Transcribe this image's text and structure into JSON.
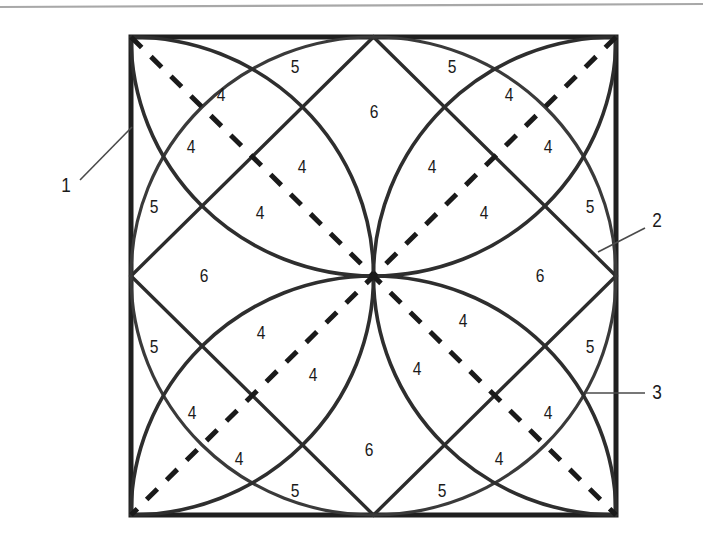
{
  "figure": {
    "background_color": "#ffffff",
    "ink_color": "#1a1a1a",
    "line_color": "#3a3a3a",
    "rule_color": "#a8a8a8",
    "square": {
      "left": 131,
      "top": 37,
      "right": 616,
      "bottom": 515
    },
    "top_rule": {
      "x1": 0,
      "y1": 7,
      "x2": 703,
      "y2": 4
    },
    "region_labels": [
      {
        "id": "r-tl-5",
        "text": "5",
        "x": 295,
        "y": 68
      },
      {
        "id": "r-tr-5",
        "text": "5",
        "x": 452,
        "y": 68
      },
      {
        "id": "r-t-6",
        "text": "6",
        "x": 374,
        "y": 113
      },
      {
        "id": "r-tl-4a",
        "text": "4",
        "x": 221,
        "y": 96
      },
      {
        "id": "r-tr-4a",
        "text": "4",
        "x": 509,
        "y": 96
      },
      {
        "id": "r-tl-4b",
        "text": "4",
        "x": 191,
        "y": 148
      },
      {
        "id": "r-tr-4b",
        "text": "4",
        "x": 548,
        "y": 148
      },
      {
        "id": "r-tl-4c",
        "text": "4",
        "x": 302,
        "y": 168
      },
      {
        "id": "r-tr-4c",
        "text": "4",
        "x": 432,
        "y": 168
      },
      {
        "id": "r-l-5a",
        "text": "5",
        "x": 154,
        "y": 208
      },
      {
        "id": "r-r-5a",
        "text": "5",
        "x": 590,
        "y": 208
      },
      {
        "id": "r-tl-4d",
        "text": "4",
        "x": 260,
        "y": 214
      },
      {
        "id": "r-tr-4d",
        "text": "4",
        "x": 484,
        "y": 214
      },
      {
        "id": "r-l-6",
        "text": "6",
        "x": 204,
        "y": 277
      },
      {
        "id": "r-r-6",
        "text": "6",
        "x": 540,
        "y": 277
      },
      {
        "id": "r-bl-4a",
        "text": "4",
        "x": 261,
        "y": 334
      },
      {
        "id": "r-br-4a",
        "text": "4",
        "x": 463,
        "y": 322
      },
      {
        "id": "r-l-5b",
        "text": "5",
        "x": 154,
        "y": 348
      },
      {
        "id": "r-r-5b",
        "text": "5",
        "x": 590,
        "y": 348
      },
      {
        "id": "r-bl-4b",
        "text": "4",
        "x": 313,
        "y": 376
      },
      {
        "id": "r-br-4b",
        "text": "4",
        "x": 417,
        "y": 370
      },
      {
        "id": "r-bl-4c",
        "text": "4",
        "x": 192,
        "y": 414
      },
      {
        "id": "r-br-4c",
        "text": "4",
        "x": 548,
        "y": 414
      },
      {
        "id": "r-bl-4d",
        "text": "4",
        "x": 239,
        "y": 460
      },
      {
        "id": "r-br-4d",
        "text": "4",
        "x": 499,
        "y": 460
      },
      {
        "id": "r-b-6",
        "text": "6",
        "x": 369,
        "y": 451
      },
      {
        "id": "r-bl-5",
        "text": "5",
        "x": 295,
        "y": 492
      },
      {
        "id": "r-br-5",
        "text": "5",
        "x": 442,
        "y": 492
      }
    ],
    "callouts": [
      {
        "id": "callout-1",
        "text": "1",
        "label_x": 66,
        "label_y": 186,
        "leader": [
          {
            "x": 80,
            "y": 180
          },
          {
            "x": 132,
            "y": 127
          }
        ],
        "points_to": "outer-square-left-edge"
      },
      {
        "id": "callout-2",
        "text": "2",
        "label_x": 657,
        "label_y": 221,
        "leader": [
          {
            "x": 645,
            "y": 228
          },
          {
            "x": 598,
            "y": 252
          }
        ],
        "points_to": "diamond-right-vertex"
      },
      {
        "id": "callout-3",
        "text": "3",
        "label_x": 657,
        "label_y": 393,
        "leader": [
          {
            "x": 645,
            "y": 393
          },
          {
            "x": 585,
            "y": 393
          }
        ],
        "points_to": "corner-arc-right"
      }
    ]
  }
}
